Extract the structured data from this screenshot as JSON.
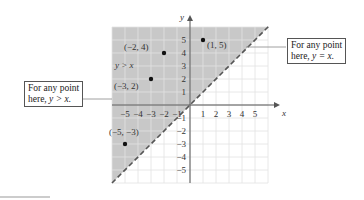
{
  "graph": {
    "x_axis_label": "x",
    "y_axis_label": "y",
    "x_ticks": [
      "−5",
      "−4",
      "−3",
      "−2",
      "−1",
      "1",
      "2",
      "3",
      "4",
      "5"
    ],
    "y_ticks": [
      "5",
      "4",
      "3",
      "2",
      "1",
      "−1",
      "−2",
      "−3",
      "−4",
      "−5"
    ],
    "region_label": "y > x",
    "line": "y = x",
    "shade_color": "#c8c8c8",
    "points": [
      {
        "label": "(−2, 4)",
        "x": -2,
        "y": 4
      },
      {
        "label": "(1, 5)",
        "x": 1,
        "y": 5
      },
      {
        "label": "(−3, 2)",
        "x": -3,
        "y": 2
      },
      {
        "label": "(−5, −3)",
        "x": -5,
        "y": -3
      }
    ]
  },
  "callouts": {
    "left": {
      "line1": "For any point",
      "line2_prefix": "here, ",
      "line2_math": "y > x."
    },
    "right": {
      "line1": "For any point",
      "line2_prefix": "here, ",
      "line2_math": "y = x."
    }
  }
}
